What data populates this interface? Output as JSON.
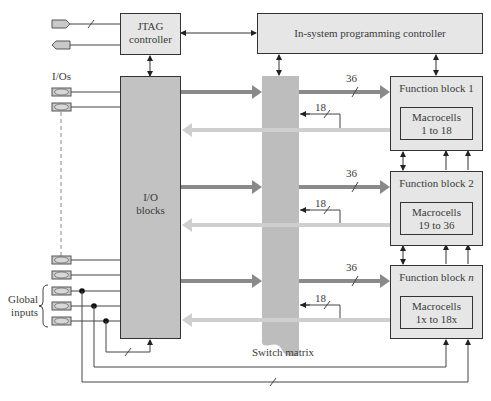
{
  "diagram": {
    "jtag": {
      "line1": "JTAG",
      "line2": "controller"
    },
    "isp": {
      "label": "In-system programming controller"
    },
    "io_blocks": {
      "line1": "I/O",
      "line2": "blocks"
    },
    "io_label": "I/Os",
    "global_inputs": {
      "line1": "Global",
      "line2": "inputs"
    },
    "switch_matrix": "Switch matrix",
    "function_blocks": [
      {
        "title": "Function block 1",
        "macro1": "Macrocells",
        "macro2": "1 to 18",
        "bus_out": "36",
        "bus_in": "18"
      },
      {
        "title": "Function block 2",
        "macro1": "Macrocells",
        "macro2": "19 to 36",
        "bus_out": "36",
        "bus_in": "18"
      },
      {
        "title": "Function block ",
        "title_italic": "n",
        "macro1": "Macrocells",
        "macro2": "1x to 18x",
        "bus_out": "36",
        "bus_in": "18"
      }
    ]
  },
  "colors": {
    "box_light": "#e6e6e6",
    "box_dark": "#c2c2c2",
    "switch": "#bdbdbd",
    "arrow_dark": "#8a8a8a",
    "arrow_light": "#cfcfcf"
  }
}
